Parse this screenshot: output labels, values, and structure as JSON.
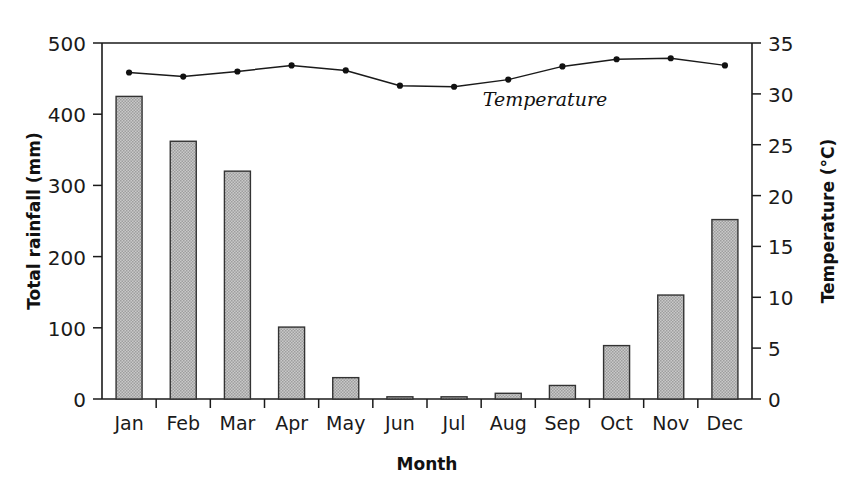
{
  "chart_data": {
    "type": "bar",
    "title": "",
    "xlabel": "Month",
    "ylabel": "Total rainfall (mm)",
    "y2label": "Temperature (°C)",
    "grid": false,
    "legend_position": "inline-annotation",
    "categories": [
      "Jan",
      "Feb",
      "Mar",
      "Apr",
      "May",
      "Jun",
      "Jul",
      "Aug",
      "Sep",
      "Oct",
      "Nov",
      "Dec"
    ],
    "ylim": [
      0,
      500
    ],
    "y2lim": [
      0,
      35
    ],
    "yticks": [
      0,
      100,
      200,
      300,
      400,
      500
    ],
    "y2ticks": [
      0,
      5,
      10,
      15,
      20,
      25,
      30,
      35
    ],
    "series": [
      {
        "name": "Total rainfall",
        "type": "bar",
        "axis": "left",
        "unit": "mm",
        "color": "#b5b5b5",
        "values": [
          425,
          362,
          320,
          101,
          30,
          3,
          2,
          8,
          19,
          75,
          146,
          252
        ]
      },
      {
        "name": "Temperature",
        "type": "line",
        "axis": "right",
        "unit": "°C",
        "color": "#1a1a1a",
        "annotation": "Temperature",
        "values": [
          32.1,
          31.7,
          32.2,
          32.8,
          32.3,
          30.8,
          30.7,
          31.4,
          32.7,
          33.4,
          33.5,
          32.8
        ]
      }
    ]
  },
  "axes": {
    "left": {
      "title": "Total rainfall (mm)",
      "tick_labels": [
        "500",
        "400",
        "300",
        "200",
        "100",
        "0"
      ]
    },
    "right": {
      "title": "Temperature (°C)",
      "tick_labels": [
        "35",
        "30",
        "25",
        "20",
        "15",
        "10",
        "5",
        "0"
      ]
    },
    "bottom": {
      "title": "Month",
      "tick_labels": [
        "Jan",
        "Feb",
        "Mar",
        "Apr",
        "May",
        "Jun",
        "Jul",
        "Aug",
        "Sep",
        "Oct",
        "Nov",
        "Dec"
      ]
    }
  },
  "annotations": {
    "temperature_label": "Temperature"
  },
  "colors": {
    "bar_fill": "#b5b5b5",
    "bar_stroke": "#333333",
    "line": "#1a1a1a",
    "axis": "#1a1a1a",
    "text": "#1a1a1a",
    "background": "#ffffff"
  }
}
